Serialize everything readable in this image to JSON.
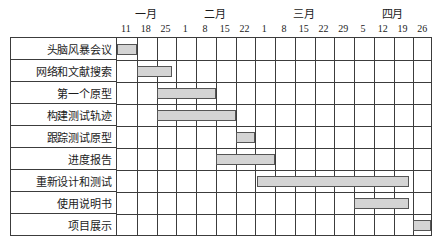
{
  "chart_data": {
    "type": "bar",
    "title": "",
    "xlabel": "",
    "ylabel": "",
    "orientation": "horizontal",
    "chart_kind": "gantt",
    "grid": true,
    "legend": "none",
    "accent_color": "#d4d4d4",
    "border_color": "#555555",
    "months": [
      {
        "label": "一月",
        "start_col": 0,
        "span": 3
      },
      {
        "label": "二月",
        "start_col": 3,
        "span": 4
      },
      {
        "label": "三月",
        "start_col": 7,
        "span": 5
      },
      {
        "label": "四月",
        "start_col": 12,
        "span": 4
      }
    ],
    "tick_labels": [
      "11",
      "18",
      "25",
      "1",
      "8",
      "15",
      "22",
      "1",
      "8",
      "15",
      "22",
      "29",
      "5",
      "12",
      "19",
      "26"
    ],
    "columns": 16,
    "categories": [
      "头脑风暴会议",
      "网络和文献搜索",
      "第一个原型",
      "构建测试轨迹",
      "跟踪测试原型",
      "进度报告",
      "重新设计和测试",
      "使用说明书",
      "项目展示"
    ],
    "tasks": [
      {
        "name": "头脑风暴会议",
        "row": 0,
        "start_col": 0.0,
        "end_col": 1.0,
        "start_tick": "11",
        "end_tick": "18"
      },
      {
        "name": "网络和文献搜索",
        "row": 1,
        "start_col": 1.0,
        "end_col": 2.8,
        "start_tick": "18",
        "end_tick": "25"
      },
      {
        "name": "第一个原型",
        "row": 2,
        "start_col": 2.0,
        "end_col": 5.0,
        "start_tick": "25",
        "end_tick": "15"
      },
      {
        "name": "构建测试轨迹",
        "row": 3,
        "start_col": 2.0,
        "end_col": 6.0,
        "start_tick": "25",
        "end_tick": "22"
      },
      {
        "name": "跟踪测试原型",
        "row": 4,
        "start_col": 6.0,
        "end_col": 7.0,
        "start_tick": "22",
        "end_tick": "1"
      },
      {
        "name": "进度报告",
        "row": 5,
        "start_col": 5.0,
        "end_col": 8.0,
        "start_tick": "15",
        "end_tick": "8"
      },
      {
        "name": "重新设计和测试",
        "row": 6,
        "start_col": 7.1,
        "end_col": 14.8,
        "start_tick": "1",
        "end_tick": "19"
      },
      {
        "name": "使用说明书",
        "row": 7,
        "start_col": 12.0,
        "end_col": 14.8,
        "start_tick": "5",
        "end_tick": "19"
      },
      {
        "name": "项目展示",
        "row": 8,
        "start_col": 15.0,
        "end_col": 15.9,
        "start_tick": "26",
        "end_tick": "26"
      }
    ]
  }
}
